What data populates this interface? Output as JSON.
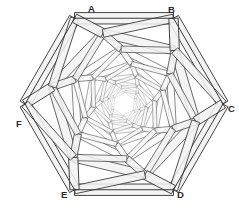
{
  "figure": {
    "name": "hexagonal-spiral-structure",
    "background_color": "#ffffff",
    "stroke_color": "#3a3a3a",
    "stroke_color_light": "#8a8a8a",
    "fill_color": "#f2f2f2",
    "fill_color_light": "#fafafa"
  },
  "labels": [
    {
      "text": "A",
      "x": 88,
      "y": 4
    },
    {
      "text": "B",
      "x": 168,
      "y": 5
    },
    {
      "text": "C",
      "x": 228,
      "y": 104
    },
    {
      "text": "D",
      "x": 177,
      "y": 190
    },
    {
      "text": "E",
      "x": 61,
      "y": 190
    },
    {
      "text": "F",
      "x": 16,
      "y": 119
    }
  ],
  "geometry": {
    "center": {
      "x": 124,
      "y": 104
    },
    "outer_radius": 99,
    "ring_count": 8,
    "scale_per_ring": 0.745,
    "rotation_per_ring_deg": 13.5,
    "base_rotation_deg": -60,
    "beam_half_width": 0.052,
    "vertex_angles_deg": [
      -120,
      -60,
      0,
      60,
      120,
      180
    ]
  },
  "chart_data": {
    "type": "diagram",
    "vertices": [
      "A",
      "B",
      "C",
      "D",
      "E",
      "F"
    ],
    "ring_radii": [
      99,
      73.8,
      55.0,
      41.0,
      30.5,
      22.7,
      16.9,
      12.6
    ],
    "ring_rotations_deg": [
      0,
      13.5,
      27,
      40.5,
      54,
      67.5,
      81,
      94.5
    ]
  }
}
